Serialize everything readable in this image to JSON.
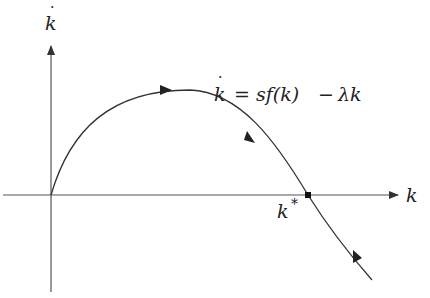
{
  "diagram": {
    "y_axis_label": "k",
    "y_axis_dot": "·",
    "x_axis_label": "k",
    "equation": {
      "lhs": "k",
      "equals": "=",
      "rhs_parts": [
        "sf(k)",
        "−",
        "λk"
      ]
    },
    "steady_state_label": "k",
    "steady_state_sup": "*",
    "colors": {
      "axis": "#555555",
      "curve": "#333333",
      "text": "#222222"
    }
  }
}
